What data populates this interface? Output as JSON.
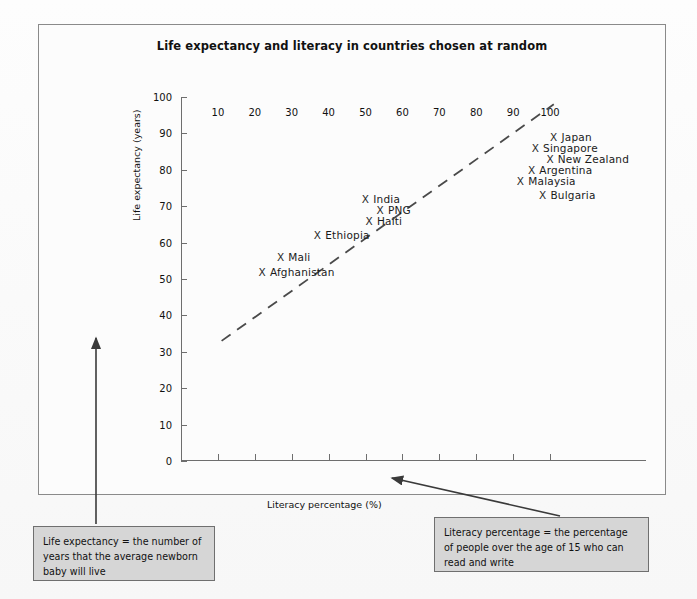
{
  "chart_data": {
    "type": "scatter",
    "title": "Life expectancy and literacy in countries chosen at random",
    "xlabel": "Literacy percentage (%)",
    "ylabel": "Life expectancy (years)",
    "xlim": [
      0,
      110
    ],
    "ylim": [
      0,
      100
    ],
    "xticks": [
      10,
      20,
      30,
      40,
      50,
      60,
      70,
      80,
      90,
      100
    ],
    "yticks": [
      0,
      10,
      20,
      30,
      40,
      50,
      60,
      70,
      80,
      90,
      100
    ],
    "grid": false,
    "legend": "none",
    "marker": "X",
    "points": [
      {
        "label": "Afghanistan",
        "x": 21,
        "y": 52,
        "label_side": "right"
      },
      {
        "label": "Mali",
        "x": 26,
        "y": 56,
        "label_side": "right"
      },
      {
        "label": "Ethiopia",
        "x": 36,
        "y": 62,
        "label_side": "right"
      },
      {
        "label": "Haiti",
        "x": 50,
        "y": 66,
        "label_side": "right"
      },
      {
        "label": "India",
        "x": 49,
        "y": 72,
        "label_side": "right"
      },
      {
        "label": "PNG",
        "x": 53,
        "y": 69,
        "label_side": "right"
      },
      {
        "label": "Bulgaria",
        "x": 97,
        "y": 73,
        "label_side": "right"
      },
      {
        "label": "Malaysia",
        "x": 91,
        "y": 77,
        "label_side": "right"
      },
      {
        "label": "Argentina",
        "x": 94,
        "y": 80,
        "label_side": "right"
      },
      {
        "label": "New Zealand",
        "x": 99,
        "y": 83,
        "label_side": "right"
      },
      {
        "label": "Singapore",
        "x": 95,
        "y": 86,
        "label_side": "right"
      },
      {
        "label": "Japan",
        "x": 100,
        "y": 89,
        "label_side": "right"
      }
    ],
    "trendline": {
      "style": "dashed",
      "x0": 11,
      "y0": 33,
      "x1": 101,
      "y1": 98
    },
    "annotations": [
      {
        "id": "life-expectancy-note",
        "text": "Life expectancy = the number of years that the average newborn baby will live",
        "points_to": "y-axis-title"
      },
      {
        "id": "literacy-note",
        "text": "Literacy percentage = the percentage of people over the age of 15 who can read and write",
        "points_to": "x-axis-title"
      }
    ]
  },
  "chart": {
    "title": "Life expectancy and literacy in countries chosen at random",
    "axis_title_y": "Life expectancy (years)",
    "axis_title_x": "Literacy percentage (%)",
    "y_tick_labels": [
      "100",
      "90",
      "80",
      "70",
      "60",
      "50",
      "40",
      "30",
      "20",
      "10",
      "0"
    ],
    "x_tick_labels": [
      "10",
      "20",
      "30",
      "40",
      "50",
      "60",
      "70",
      "80",
      "90",
      "100"
    ],
    "marker_glyph": "X",
    "point_labels": [
      "Afghanistan",
      "Mali",
      "Ethiopia",
      "Haiti",
      "India",
      "PNG",
      "Bulgaria",
      "Malaysia",
      "Argentina",
      "New Zealand",
      "Singapore",
      "Japan"
    ]
  },
  "notes": {
    "left": "Life expectancy = the number of years that the average newborn baby will live",
    "right": "Literacy percentage = the percentage of people over the age of 15 who can read and write"
  },
  "colors": {
    "note_fill": "#d6d6d6",
    "note_border": "#6f6f6f",
    "axis": "#6e6e6e",
    "frame": "#8a8a8a",
    "text": "#1a1a1a"
  }
}
